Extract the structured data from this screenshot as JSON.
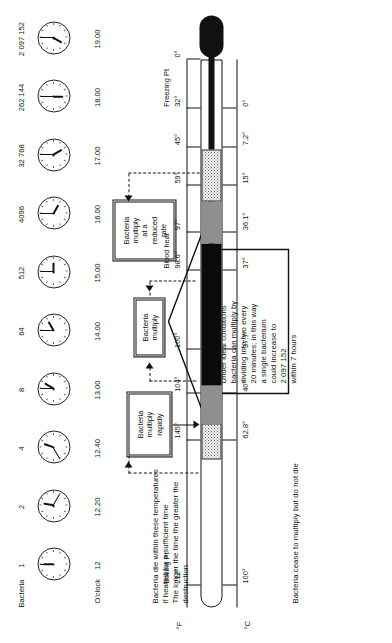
{
  "figure": {
    "orientation": "rotated-90"
  },
  "clock_row": {
    "bacteria_header": "Bacteria",
    "time_header": "O'clock",
    "items": [
      {
        "time": "12",
        "count": "1",
        "hour_deg": -90,
        "minute_deg": -90
      },
      {
        "time": "12.20",
        "count": "2",
        "hour_deg": -80,
        "minute_deg": 30
      },
      {
        "time": "12.40",
        "count": "4",
        "hour_deg": -70,
        "minute_deg": 150
      },
      {
        "time": "13.00",
        "count": "8",
        "hour_deg": -60,
        "minute_deg": -90
      },
      {
        "time": "14.00",
        "count": "64",
        "hour_deg": -30,
        "minute_deg": -90
      },
      {
        "time": "15.00",
        "count": "512",
        "hour_deg": 0,
        "minute_deg": -90
      },
      {
        "time": "16.00",
        "count": "4096",
        "hour_deg": 30,
        "minute_deg": -90
      },
      {
        "time": "17.00",
        "count": "32 768",
        "hour_deg": 60,
        "minute_deg": -90
      },
      {
        "time": "18.00",
        "count": "262 144",
        "hour_deg": 90,
        "minute_deg": -90
      },
      {
        "time": "19.00",
        "count": "2 097 152",
        "hour_deg": 120,
        "minute_deg": -90
      }
    ]
  },
  "arrow_callout": {
    "text": "Under ideal conditions\nbacteria can multiply by\ndividing into two every\n20 minutes; in this way\na single bacterium\ncould increase to\n2 097 152\nwithin 7 hours"
  },
  "flow_boxes": [
    {
      "id": "rapid",
      "label": "Bacteria\nmultiply\nrapidly"
    },
    {
      "id": "normal",
      "label": "Bacteria\nmultiply"
    },
    {
      "id": "reduced",
      "label": "Bacteria\nmultiply\nat a\nreduced\nrate"
    }
  ],
  "annotations": {
    "hot": "Bacteria die within these temperatures\nif heated for a sufficient time\nThe longer the time the greater the\ndestruction",
    "cold": "Bacteria cease to multiply but do not die"
  },
  "thermometer": {
    "unit_f": "°F",
    "unit_c": "°C",
    "fahrenheit_ticks": [
      {
        "value": "212°",
        "note": "Boiling Pt",
        "pos": 4
      },
      {
        "value": "145°",
        "note": "",
        "pos": 30.5
      },
      {
        "value": "104°",
        "note": "",
        "pos": 39.0
      },
      {
        "value": "100°",
        "note": "",
        "pos": 47.0
      },
      {
        "value": "98.6°",
        "note": "Blood heat",
        "pos": 61.5
      },
      {
        "value": "97°",
        "note": "",
        "pos": 68.5
      },
      {
        "value": "59°",
        "note": "",
        "pos": 77.0
      },
      {
        "value": "45°",
        "note": "",
        "pos": 84.0
      },
      {
        "value": "32°",
        "note": "Freezing Pt",
        "pos": 91.0
      },
      {
        "value": "0°",
        "note": "",
        "pos": 100
      }
    ],
    "celsius_ticks": [
      {
        "value": "100°",
        "pos": 4
      },
      {
        "value": "62.8°",
        "pos": 30.5
      },
      {
        "value": "40°",
        "pos": 39.0
      },
      {
        "value": "37.7°",
        "pos": 47.0
      },
      {
        "value": "37°",
        "pos": 61.5
      },
      {
        "value": "36.1°",
        "pos": 68.5
      },
      {
        "value": "15°",
        "pos": 77.0
      },
      {
        "value": "7.2°",
        "pos": 84.0
      },
      {
        "value": "0°",
        "pos": 91.0
      }
    ],
    "bands": [
      {
        "kind": "speck",
        "start": 27.0,
        "end": 33.5
      },
      {
        "kind": "grey",
        "start": 33.5,
        "end": 40.5
      },
      {
        "kind": "black",
        "start": 40.5,
        "end": 66.5
      },
      {
        "kind": "grey",
        "start": 66.5,
        "end": 74.0
      },
      {
        "kind": "speck",
        "start": 74.0,
        "end": 83.5
      }
    ]
  },
  "colors": {
    "ink": "#111111",
    "band_black": "#0a0a0a",
    "band_grey": "#8f8f8f",
    "paper": "#ffffff"
  }
}
